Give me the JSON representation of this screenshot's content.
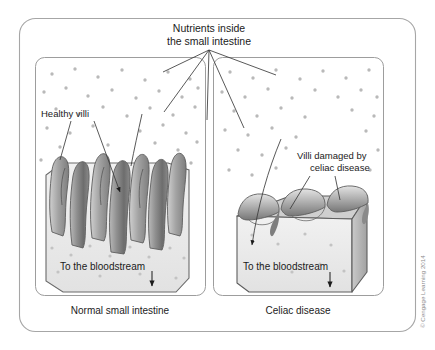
{
  "figure": {
    "title_line1": "Nutrients inside",
    "title_line2": "the small intestine",
    "credit": "© Cengage Learning 2014",
    "accent_color": "#6e6e6e",
    "line_color": "#5a5a5a",
    "dot_color": "#b5b5b5",
    "panel_border_color": "#9a9a9a",
    "frame_border_color": "#a0a0a0",
    "villi_light": "#d8d8d8",
    "villi_mid": "#9d9d9d",
    "villi_dark": "#6b6b6b",
    "block_fill": "#ececec"
  },
  "panels": [
    {
      "id": "normal",
      "caption": "Normal small intestine",
      "label_line1": "Healthy villi",
      "label_line2": "",
      "bloodstream_label": "To the bloodstream"
    },
    {
      "id": "celiac",
      "caption": "Celiac disease",
      "label_line1": "Villi damaged by",
      "label_line2": "celiac disease",
      "bloodstream_label": "To the bloodstream"
    }
  ]
}
